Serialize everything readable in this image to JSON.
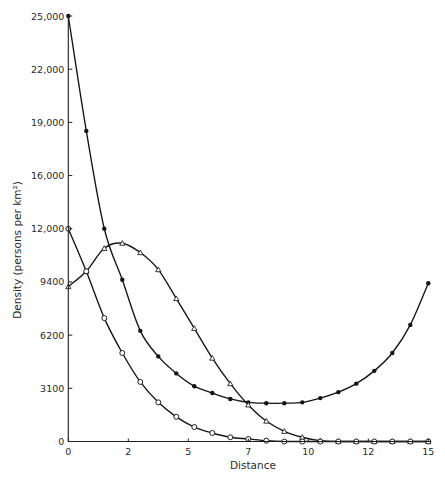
{
  "chart_data": {
    "type": "line",
    "title": "",
    "xlabel": "Distance",
    "ylabel": "Density (persons per km²)",
    "xlim": [
      0,
      15
    ],
    "ylim": [
      0,
      25000
    ],
    "grid": false,
    "legend": null,
    "x_ticks": [
      {
        "value": 0,
        "label": "0"
      },
      {
        "value": 2.5,
        "label": "2"
      },
      {
        "value": 5,
        "label": "5"
      },
      {
        "value": 7.5,
        "label": "7"
      },
      {
        "value": 10,
        "label": "10"
      },
      {
        "value": 12.5,
        "label": "12"
      },
      {
        "value": 15,
        "label": "15"
      }
    ],
    "y_ticks": [
      {
        "value": 0,
        "label": "0"
      },
      {
        "value": 3125,
        "label": "3100"
      },
      {
        "value": 6250,
        "label": "6200"
      },
      {
        "value": 9375,
        "label": "9400"
      },
      {
        "value": 12500,
        "label": "12,000"
      },
      {
        "value": 15625,
        "label": "16,000"
      },
      {
        "value": 18750,
        "label": "19,000"
      },
      {
        "value": 21875,
        "label": "22,000"
      },
      {
        "value": 25000,
        "label": "25,000"
      }
    ],
    "x": [
      0,
      0.75,
      1.5,
      2.25,
      3,
      3.75,
      4.5,
      5.25,
      6,
      6.75,
      7.5,
      8.25,
      9,
      9.75,
      10.5,
      11.25,
      12,
      12.75,
      13.5,
      14.25,
      15
    ],
    "series": [
      {
        "name": "filled-dot series (decay then rise)",
        "marker": "filled-circle",
        "values": [
          25000,
          18250,
          12500,
          9500,
          6500,
          5000,
          4000,
          3250,
          2850,
          2500,
          2300,
          2250,
          2250,
          2300,
          2550,
          2900,
          3400,
          4150,
          5200,
          6850,
          9300
        ]
      },
      {
        "name": "open-triangle series (hump)",
        "marker": "open-triangle",
        "values": [
          9100,
          10000,
          11350,
          11650,
          11100,
          10100,
          8400,
          6650,
          4900,
          3400,
          2150,
          1200,
          600,
          250,
          50,
          0,
          0,
          0,
          0,
          0,
          0
        ]
      },
      {
        "name": "open-circle series (decay)",
        "marker": "open-circle",
        "values": [
          12500,
          10000,
          7250,
          5200,
          3500,
          2300,
          1450,
          850,
          500,
          250,
          150,
          50,
          0,
          0,
          0,
          0,
          0,
          0,
          0,
          0,
          0
        ]
      }
    ],
    "colors": {
      "ink": "#141414",
      "background": "#ffffff"
    }
  }
}
